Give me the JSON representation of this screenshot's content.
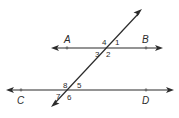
{
  "diagram": {
    "type": "parallel-lines-cut-by-transversal",
    "colors": {
      "stroke": "#2b2b2b",
      "point": "#6b6b6b",
      "background": "#ffffff"
    },
    "lines": [
      {
        "name": "AB",
        "points": [
          "A",
          "B"
        ]
      },
      {
        "name": "CD",
        "points": [
          "C",
          "D"
        ]
      },
      {
        "name": "transversal"
      }
    ],
    "points": {
      "A": "A",
      "B": "B",
      "C": "C",
      "D": "D"
    },
    "angles": {
      "a1": "1",
      "a2": "2",
      "a3": "3",
      "a4": "4",
      "a5": "5",
      "a6": "6",
      "a7": "7",
      "a8": "8"
    }
  }
}
